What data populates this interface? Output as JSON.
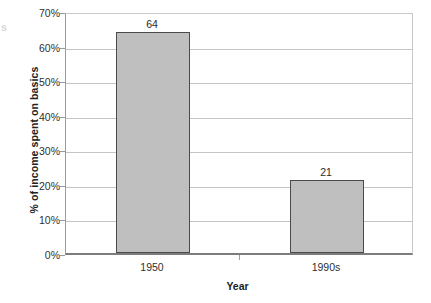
{
  "chart_data": {
    "type": "bar",
    "title": "",
    "subtitle": "",
    "xlabel": "Year",
    "ylabel": "% of income spent on basics",
    "categories": [
      "1950",
      "1990s"
    ],
    "values": [
      64,
      21
    ],
    "value_labels": [
      "64",
      "21"
    ],
    "series": [
      {
        "name": "% of income spent on basics",
        "values": [
          64,
          21
        ]
      }
    ],
    "ylim": [
      0,
      70
    ],
    "y_tick_values": [
      0,
      10,
      20,
      30,
      40,
      50,
      60,
      70
    ],
    "y_tick_labels": [
      "0%",
      "10%",
      "20%",
      "30%",
      "40%",
      "50%",
      "60%",
      "70%"
    ],
    "grid": true,
    "grid_axis": "y",
    "legend": false,
    "legend_position": "none",
    "bar_fill_color": "#bfbfbf",
    "bar_border_color": "#4a4a4a",
    "gridline_color": "#c4c4c4",
    "axis_color": "#7c7c7c",
    "text_color": "#2b2b2b",
    "background_color": "#ffffff",
    "data_labels_shown": true,
    "annotations": []
  },
  "artifact": {
    "fragment": "s"
  }
}
